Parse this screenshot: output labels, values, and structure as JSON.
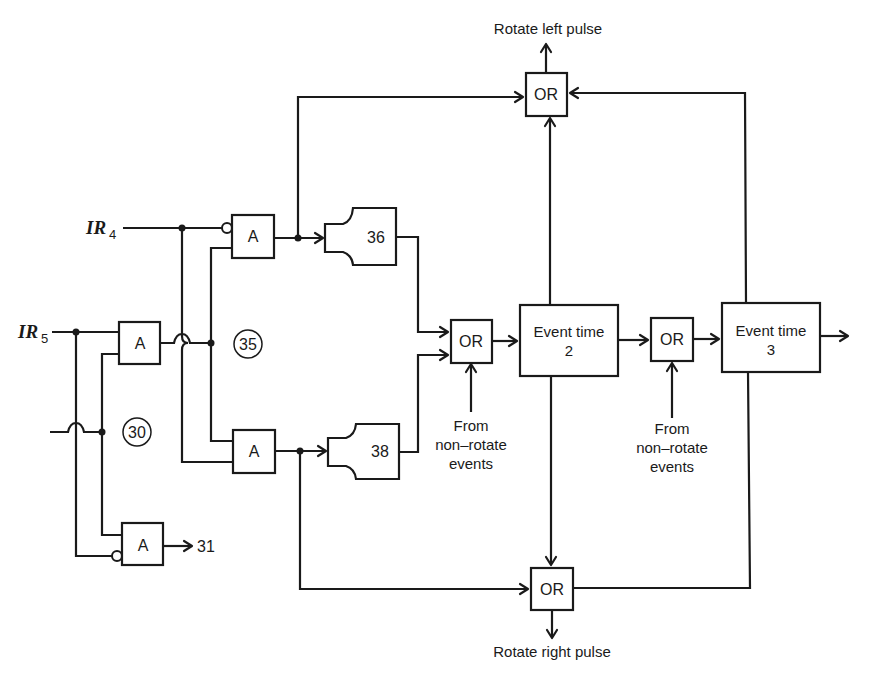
{
  "diagram": {
    "inputs": {
      "ir4": {
        "name": "IR",
        "subscript": "4"
      },
      "ir5": {
        "name": "IR",
        "subscript": "5"
      }
    },
    "gates": {
      "and_a1": {
        "label": "A",
        "type": "AND",
        "negated_input": "IR4"
      },
      "and_a2": {
        "label": "A",
        "type": "AND"
      },
      "and_a3": {
        "label": "A",
        "type": "AND"
      },
      "and_a4": {
        "label": "A",
        "type": "AND",
        "negated_input": "IR5"
      },
      "or_top": {
        "label": "OR"
      },
      "or_mid": {
        "label": "OR"
      },
      "or_right": {
        "label": "OR"
      },
      "or_bottom": {
        "label": "OR"
      }
    },
    "modules": {
      "m36": {
        "label": "36"
      },
      "m38": {
        "label": "38"
      }
    },
    "event_boxes": {
      "et2": {
        "line1": "Event time",
        "line2": "2"
      },
      "et3": {
        "line1": "Event time",
        "line2": "3"
      }
    },
    "node_labels": {
      "n30": "30",
      "n35": "35"
    },
    "outputs": {
      "a4_out": "31",
      "rotate_left": "Rotate left pulse",
      "rotate_right": "Rotate right pulse"
    },
    "annotations": {
      "from_nonrotate_1": {
        "line1": "From",
        "line2": "non–rotate",
        "line3": "events"
      },
      "from_nonrotate_2": {
        "line1": "From",
        "line2": "non–rotate",
        "line3": "events"
      }
    }
  }
}
